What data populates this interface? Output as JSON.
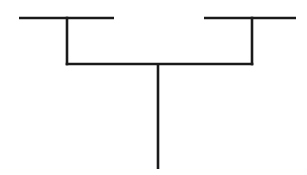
{
  "figure": {
    "type": "cladogram",
    "title": "",
    "background_color": "#ffffff",
    "line_color": "#1a1a1a",
    "line_width": 2.6,
    "width": 307,
    "height": 175
  },
  "diagram": {
    "root": {
      "label": "root-stem",
      "x": 158,
      "y_top": 64,
      "y_bottom": 169
    },
    "internal_node": {
      "label": "internal-node-bar",
      "x_left": 67,
      "x_right": 252,
      "y": 64
    },
    "clades": [
      {
        "name": "left-clade",
        "descender": {
          "x": 67,
          "y_top": 18,
          "y_bottom": 64
        },
        "terminal_branch": {
          "y": 18,
          "x_start": 19,
          "x_end": 114
        },
        "tip_label": ""
      },
      {
        "name": "right-clade",
        "descender": {
          "x": 252,
          "y_top": 18,
          "y_bottom": 64
        },
        "terminal_branch": {
          "y": 18,
          "x_start": 204,
          "x_end": 296
        },
        "tip_label": ""
      }
    ]
  },
  "chart_data": {
    "type": "diagram",
    "title": "",
    "xlabel": "",
    "ylabel": "",
    "nodes": [
      {
        "id": "root",
        "x": 158,
        "y": 169,
        "label": ""
      },
      {
        "id": "node1",
        "x": 158,
        "y": 64,
        "label": ""
      },
      {
        "id": "tipA",
        "x": 67,
        "y": 18,
        "label": ""
      },
      {
        "id": "tipB",
        "x": 252,
        "y": 18,
        "label": ""
      }
    ],
    "edges": [
      {
        "from": "root",
        "to": "node1"
      },
      {
        "from": "node1",
        "to": "tipA"
      },
      {
        "from": "node1",
        "to": "tipB"
      }
    ]
  }
}
